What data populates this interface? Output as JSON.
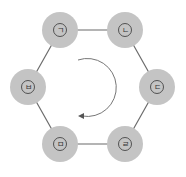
{
  "diagram": {
    "type": "hexagon-cycle",
    "colors": {
      "node_fill": "#c4c4c4",
      "edge": "#6a6a6a",
      "inner_ring": "#444444",
      "arrow": "#777777"
    },
    "nodes": [
      {
        "id": "n1",
        "label": "ㄱ",
        "position": "top-left"
      },
      {
        "id": "n2",
        "label": "ㄴ",
        "position": "top-right"
      },
      {
        "id": "n3",
        "label": "ㄷ",
        "position": "right"
      },
      {
        "id": "n4",
        "label": "ㄹ",
        "position": "bottom-right"
      },
      {
        "id": "n5",
        "label": "ㅁ",
        "position": "bottom-left"
      },
      {
        "id": "n6",
        "label": "ㅂ",
        "position": "left"
      }
    ],
    "rotation_arrow": "clockwise"
  }
}
